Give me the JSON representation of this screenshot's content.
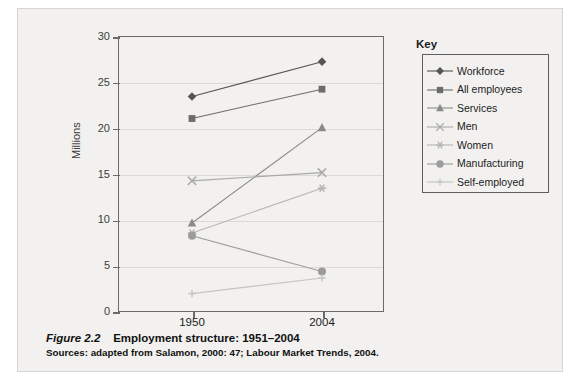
{
  "figure": {
    "number_label": "Figure 2.2",
    "title": "Employment structure: 1951–2004",
    "sources": "Sources: adapted from Salamon, 2000: 47; Labour Market Trends, 2004."
  },
  "legend": {
    "title": "Key"
  },
  "chart_data": {
    "type": "line",
    "title": "Employment structure: 1951–2004",
    "xlabel": "",
    "ylabel": "Millions",
    "categories": [
      "1950",
      "2004"
    ],
    "x_tick_labels": [
      "1950",
      "2004"
    ],
    "y_tick_labels": [
      "0",
      "5",
      "10",
      "15",
      "20",
      "25",
      "30"
    ],
    "y_ticks": [
      0,
      5,
      10,
      15,
      20,
      25,
      30
    ],
    "ylim": [
      0,
      30
    ],
    "grid": true,
    "legend_position": "right-outside",
    "series": [
      {
        "name": "Workforce",
        "marker": "diamond",
        "color": "#555555",
        "values": [
          23.4,
          27.2
        ]
      },
      {
        "name": "All employees",
        "marker": "square",
        "color": "#6b6b6b",
        "values": [
          21.0,
          24.2
        ]
      },
      {
        "name": "Services",
        "marker": "triangle",
        "color": "#8a8a8a",
        "values": [
          9.6,
          20.0
        ]
      },
      {
        "name": "Men",
        "marker": "cross",
        "color": "#a8a8a8",
        "values": [
          14.2,
          15.1
        ]
      },
      {
        "name": "Women",
        "marker": "star",
        "color": "#b5b5b5",
        "values": [
          8.5,
          13.4
        ]
      },
      {
        "name": "Manufacturing",
        "marker": "circle",
        "color": "#9c9c9c",
        "values": [
          8.2,
          4.3
        ]
      },
      {
        "name": "Self-employed",
        "marker": "plus",
        "color": "#c4c4c4",
        "values": [
          1.9,
          3.6
        ]
      }
    ]
  }
}
